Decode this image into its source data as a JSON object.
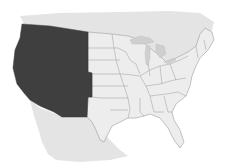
{
  "map": {
    "subject": "Contiguous United States",
    "highlighted_region": {
      "name": "Western United States",
      "states": [
        "Washington",
        "Oregon",
        "California",
        "Idaho",
        "Nevada",
        "Montana",
        "Wyoming",
        "Utah",
        "Colorado",
        "Arizona",
        "New Mexico"
      ]
    },
    "other_region": {
      "name": "Rest of contiguous United States"
    },
    "neighbors": [
      "Canada",
      "Mexico"
    ],
    "colors": {
      "highlight": "#3f3f3f",
      "other_states": "#ededed",
      "neighbors": "#e4e4e4",
      "borders": "#8a8a8a",
      "background": "#ffffff",
      "lakes": "#cfcfcf"
    }
  }
}
